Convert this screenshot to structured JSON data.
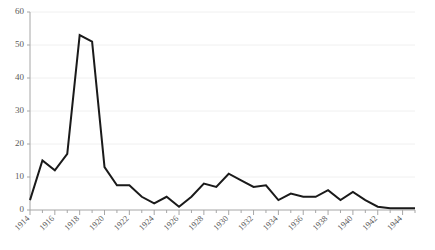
{
  "chart_data": {
    "type": "line",
    "title": "",
    "subtitle": "",
    "xlabel": "",
    "ylabel": "",
    "grid": true,
    "legend": false,
    "legend_position": "none",
    "line_color": "#1a1a1a",
    "gridline_color": "#f0f0f0",
    "axis_color": "#a6a6a6",
    "tick_label_color": "#5a5a5a",
    "xlim": [
      1914,
      1945
    ],
    "ylim": [
      0,
      60
    ],
    "ytick_values": [
      0,
      10,
      20,
      30,
      40,
      50,
      60
    ],
    "ytick_labels": [
      "0",
      "10",
      "20",
      "30",
      "40",
      "50",
      "60"
    ],
    "xtick_values": [
      1914,
      1916,
      1918,
      1920,
      1922,
      1924,
      1926,
      1928,
      1930,
      1932,
      1934,
      1936,
      1938,
      1940,
      1942,
      1944
    ],
    "xtick_labels": [
      "1914",
      "1916",
      "1918",
      "1920",
      "1922",
      "1924",
      "1926",
      "1928",
      "1930",
      "1932",
      "1934",
      "1936",
      "1938",
      "1940",
      "1942",
      "1944"
    ],
    "xtick_rotation_deg": 45,
    "x": [
      1914,
      1915,
      1916,
      1917,
      1918,
      1919,
      1920,
      1921,
      1922,
      1923,
      1924,
      1925,
      1926,
      1927,
      1928,
      1929,
      1930,
      1931,
      1932,
      1933,
      1934,
      1935,
      1936,
      1937,
      1938,
      1939,
      1940,
      1941,
      1942,
      1943,
      1944,
      1945
    ],
    "values": [
      3,
      15,
      12,
      17,
      53,
      51,
      13,
      7.5,
      7.5,
      4,
      2,
      4,
      1,
      4,
      8,
      7,
      11,
      9,
      7,
      7.5,
      3,
      5,
      4,
      4,
      6,
      3,
      5.5,
      3,
      1,
      0.5,
      0.5,
      0.5
    ],
    "series": [
      {
        "name": "series-1",
        "values": [
          3,
          15,
          12,
          17,
          53,
          51,
          13,
          7.5,
          7.5,
          4,
          2,
          4,
          1,
          4,
          8,
          7,
          11,
          9,
          7,
          7.5,
          3,
          5,
          4,
          4,
          6,
          3,
          5.5,
          3,
          1,
          0.5,
          0.5,
          0.5
        ]
      }
    ]
  }
}
